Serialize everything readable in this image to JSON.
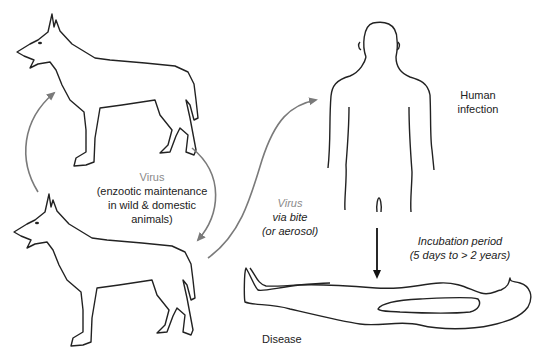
{
  "diagram": {
    "colors": {
      "outline": "#222222",
      "arrow": "#7a7a7a",
      "virus_label": "#8a8a8a",
      "text": "#222222"
    },
    "nodes": [
      {
        "id": "dog-top",
        "icon": "dog-icon"
      },
      {
        "id": "dog-bottom",
        "icon": "dog-icon"
      },
      {
        "id": "human-standing",
        "icon": "human-body-icon"
      },
      {
        "id": "human-lying",
        "icon": "lying-body-icon"
      }
    ],
    "labels": {
      "enzootic": {
        "virus": "Virus",
        "line1": "(enzootic maintenance",
        "line2": "in wild & domestic",
        "line3": "animals)"
      },
      "transmission": {
        "virus": "Virus",
        "line1": "via bite",
        "line2": "(or aerosol)"
      },
      "human_infection": {
        "line1": "Human",
        "line2": "infection"
      },
      "incubation": {
        "line1": "Incubation period",
        "line2": "(5 days to > 2 years)"
      },
      "disease": "Disease"
    },
    "edges": [
      {
        "from": "dog-bottom",
        "to": "dog-top",
        "style": "gray-curved-arrow"
      },
      {
        "from": "dog-top",
        "to": "dog-bottom",
        "style": "gray-curved-arrow"
      },
      {
        "from": "dog-bottom",
        "to": "human-standing",
        "style": "gray-curved-arrow"
      },
      {
        "from": "human-standing",
        "to": "human-lying",
        "style": "black-straight-arrow"
      }
    ]
  }
}
